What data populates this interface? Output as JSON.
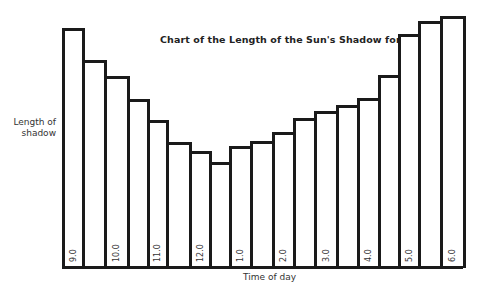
{
  "chart_data": {
    "type": "bar",
    "title": "Chart of the Length of the Sun's Shadow for a Day",
    "xlabel": "Time of day",
    "ylabel": "Length of shadow",
    "categories": [
      "9.0",
      "9.5",
      "10.0",
      "10.5",
      "11.0",
      "11.5",
      "12.0",
      "12.5",
      "1.0",
      "1.5",
      "2.0",
      "2.5",
      "3.0",
      "3.5",
      "4.0",
      "4.5",
      "5.0",
      "5.5",
      "6.0"
    ],
    "tick_labels": [
      "9.0",
      "",
      "10.0",
      "",
      "11.0",
      "",
      "12.0",
      "",
      "1.0",
      "",
      "2.0",
      "",
      "3.0",
      "",
      "4.0",
      "",
      "5.0",
      "",
      "6.0"
    ],
    "values": [
      240,
      208,
      192,
      169,
      148,
      126,
      117,
      106,
      122,
      127,
      136,
      150,
      157,
      163,
      170,
      193,
      234,
      247,
      252
    ],
    "value_units": "relative bar height (px, no y-axis scale shown)",
    "grid": false,
    "legend": null
  },
  "labels": {
    "title": "Chart of the Length of the Sun's Shadow for a Day",
    "ylabel_line1": "Length of",
    "ylabel_line2": "shadow",
    "xlabel": "Time of day"
  }
}
